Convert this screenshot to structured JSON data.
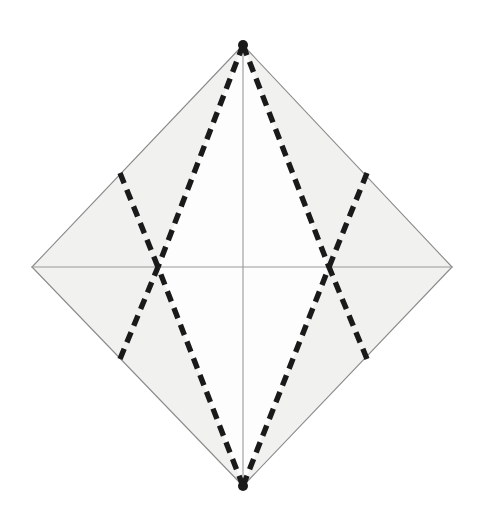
{
  "document": {
    "title": "Octahedron / Diamond Net Line Drawing",
    "background_color": "#ffffff",
    "width": 486,
    "height": 516,
    "caption": ""
  },
  "figure": {
    "name": "diamond-net-figure",
    "fill_color": "#f1f1ef",
    "inner_fill_color": "#fdfdfd",
    "outline_color": "#8b8b8b",
    "outline_width": 1.1,
    "median_color": "#9a9a9a",
    "median_width": 1.1,
    "dash_color": "#1a1a1a",
    "dash_width": 5.4,
    "dash_pattern": "11 7",
    "vertices": {
      "top": {
        "label": "Top apex",
        "x": 243,
        "y": 45
      },
      "left": {
        "label": "Left vertex",
        "x": 32,
        "y": 267
      },
      "right": {
        "label": "Right vertex",
        "x": 452,
        "y": 267
      },
      "bottom": {
        "label": "Bottom apex",
        "x": 243,
        "y": 486
      },
      "center": {
        "label": "Center",
        "x": 243,
        "y": 267
      },
      "cross_left": {
        "label": "Left crossing node",
        "x": 158,
        "y": 267
      },
      "cross_right": {
        "label": "Right crossing node",
        "x": 329,
        "y": 267
      },
      "edge_upper_left": {
        "label": "Upper-left edge point",
        "x": 120,
        "y": 173
      },
      "edge_upper_right": {
        "label": "Upper-right edge point",
        "x": 367,
        "y": 173
      },
      "edge_lower_left": {
        "label": "Lower-left edge point",
        "x": 120,
        "y": 359
      },
      "edge_lower_right": {
        "label": "Lower-right edge point",
        "x": 367,
        "y": 359
      }
    },
    "solid_lines": [
      {
        "name": "outline-top-left-edge",
        "from": "top",
        "to": "left"
      },
      {
        "name": "outline-top-right-edge",
        "from": "top",
        "to": "right"
      },
      {
        "name": "outline-bottom-left-edge",
        "from": "left",
        "to": "bottom"
      },
      {
        "name": "outline-bottom-right-edge",
        "from": "right",
        "to": "bottom"
      },
      {
        "name": "median-vertical",
        "from": "top",
        "to": "bottom"
      },
      {
        "name": "median-horizontal",
        "from": "left",
        "to": "right"
      }
    ],
    "dashed_lines": [
      {
        "name": "dash-top-to-cross-left",
        "from": "top",
        "to": "cross_left"
      },
      {
        "name": "dash-top-to-cross-right",
        "from": "top",
        "to": "cross_right"
      },
      {
        "name": "dash-bottom-to-cross-left",
        "from": "bottom",
        "to": "cross_left"
      },
      {
        "name": "dash-bottom-to-cross-right",
        "from": "bottom",
        "to": "cross_right"
      },
      {
        "name": "dash-upper-left-edge-to-cross-left",
        "from": "edge_upper_left",
        "to": "cross_left"
      },
      {
        "name": "dash-upper-right-edge-to-cross-right",
        "from": "edge_upper_right",
        "to": "cross_right"
      },
      {
        "name": "dash-lower-left-edge-to-cross-left",
        "from": "edge_lower_left",
        "to": "cross_left"
      },
      {
        "name": "dash-lower-right-edge-to-cross-right",
        "from": "edge_lower_right",
        "to": "cross_right"
      }
    ],
    "vertex_markers": [
      {
        "name": "marker-top-apex",
        "at": "top",
        "radius": 5
      },
      {
        "name": "marker-bottom-apex",
        "at": "bottom",
        "radius": 5
      }
    ]
  }
}
